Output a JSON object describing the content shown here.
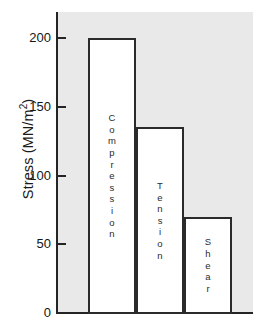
{
  "chart_data": {
    "type": "bar",
    "title": "",
    "subtitle": "",
    "xlabel": "",
    "ylabel": "Stress (MN/m2)",
    "ylabel_text": "Stress (MN/m",
    "ylabel_sup": "2",
    "ylabel_close": ")",
    "categories": [
      "Compression",
      "Tension",
      "Shear"
    ],
    "values": [
      200,
      135,
      70
    ],
    "ylim": [
      0,
      215
    ],
    "yticks": [
      0,
      50,
      100,
      150,
      200
    ],
    "ytick_labels": [
      "0",
      "50",
      "100",
      "150",
      "200"
    ],
    "grid": false,
    "legend": null,
    "units": "MN/m2",
    "bar_labels_orientation": "stacked-vertical-letters",
    "bar_fill_color": "#ffffff",
    "bar_edge_color": "#2b2b2b",
    "plot_background_color": "#e9e9e9",
    "axis_color": "#242424",
    "figure_background_color": "#ffffff"
  },
  "bars": [
    {
      "name": "Compression",
      "value": 200,
      "letters": [
        "C",
        "o",
        "m",
        "p",
        "r",
        "e",
        "s",
        "s",
        "i",
        "o",
        "n"
      ]
    },
    {
      "name": "Tension",
      "value": 135,
      "letters": [
        "T",
        "e",
        "n",
        "s",
        "i",
        "o",
        "n"
      ]
    },
    {
      "name": "Shear",
      "value": 70,
      "letters": [
        "S",
        "h",
        "e",
        "a",
        "r"
      ]
    }
  ],
  "axis": {
    "ticks": [
      {
        "label": "200",
        "value": 200
      },
      {
        "label": "150",
        "value": 150
      },
      {
        "label": "100",
        "value": 100
      },
      {
        "label": "50",
        "value": 50
      },
      {
        "label": "0",
        "value": 0
      }
    ]
  }
}
